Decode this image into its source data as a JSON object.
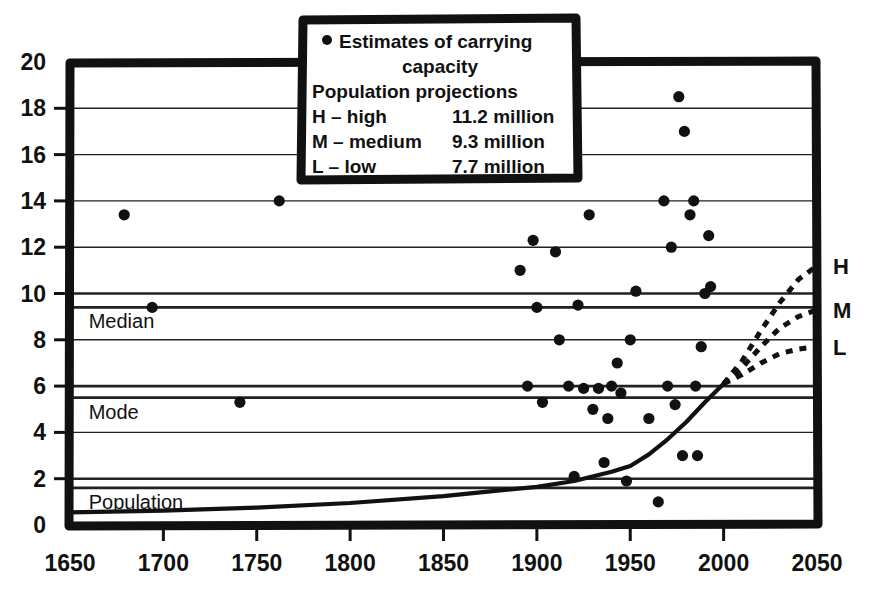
{
  "chart_data": {
    "type": "scatter",
    "title": "",
    "subtitle": "",
    "xlabel": "",
    "ylabel": "",
    "xlim": [
      1650,
      2050
    ],
    "ylim": [
      0,
      20
    ],
    "grid": true,
    "x_ticks": [
      1650,
      1700,
      1750,
      1800,
      1850,
      1900,
      1950,
      2000,
      2050
    ],
    "y_ticks": [
      0,
      2,
      4,
      6,
      8,
      10,
      12,
      14,
      16,
      18,
      20
    ],
    "legend_position": "top-center",
    "series": [
      {
        "name": "Estimates of carrying capacity",
        "type": "scatter",
        "marker": "filled-circle",
        "points": [
          [
            1679,
            13.4
          ],
          [
            1694,
            9.4
          ],
          [
            1741,
            5.3
          ],
          [
            1762,
            14.0
          ],
          [
            1891,
            11.0
          ],
          [
            1895,
            6.0
          ],
          [
            1898,
            12.3
          ],
          [
            1900,
            9.4
          ],
          [
            1903,
            5.3
          ],
          [
            1910,
            11.8
          ],
          [
            1912,
            8.0
          ],
          [
            1917,
            6.0
          ],
          [
            1920,
            2.1
          ],
          [
            1922,
            9.5
          ],
          [
            1925,
            5.9
          ],
          [
            1928,
            13.4
          ],
          [
            1930,
            5.0
          ],
          [
            1933,
            5.9
          ],
          [
            1936,
            2.7
          ],
          [
            1938,
            4.6
          ],
          [
            1940,
            6.0
          ],
          [
            1943,
            7.0
          ],
          [
            1945,
            5.7
          ],
          [
            1948,
            1.9
          ],
          [
            1950,
            8.0
          ],
          [
            1953,
            10.1
          ],
          [
            1960,
            4.6
          ],
          [
            1965,
            1.0
          ],
          [
            1968,
            14.0
          ],
          [
            1970,
            6.0
          ],
          [
            1972,
            12.0
          ],
          [
            1974,
            5.2
          ],
          [
            1976,
            18.5
          ],
          [
            1978,
            3.0
          ],
          [
            1979,
            17.0
          ],
          [
            1982,
            13.4
          ],
          [
            1984,
            14.0
          ],
          [
            1985,
            6.0
          ],
          [
            1986,
            3.0
          ],
          [
            1988,
            7.7
          ],
          [
            1990,
            10.0
          ],
          [
            1992,
            12.5
          ],
          [
            1993,
            10.3
          ]
        ]
      },
      {
        "name": "Population",
        "type": "line",
        "style": "solid",
        "points": [
          [
            1650,
            0.55
          ],
          [
            1700,
            0.62
          ],
          [
            1750,
            0.75
          ],
          [
            1800,
            0.95
          ],
          [
            1850,
            1.25
          ],
          [
            1875,
            1.45
          ],
          [
            1900,
            1.65
          ],
          [
            1920,
            1.9
          ],
          [
            1940,
            2.3
          ],
          [
            1950,
            2.55
          ],
          [
            1960,
            3.05
          ],
          [
            1970,
            3.7
          ],
          [
            1980,
            4.45
          ],
          [
            1990,
            5.3
          ],
          [
            2000,
            6.1
          ]
        ]
      },
      {
        "name": "H",
        "type": "line",
        "style": "dotted",
        "points": [
          [
            2000,
            6.1
          ],
          [
            2010,
            7.1
          ],
          [
            2020,
            8.4
          ],
          [
            2030,
            9.6
          ],
          [
            2040,
            10.6
          ],
          [
            2050,
            11.2
          ]
        ]
      },
      {
        "name": "M",
        "type": "line",
        "style": "dotted",
        "points": [
          [
            2000,
            6.1
          ],
          [
            2010,
            6.8
          ],
          [
            2020,
            7.7
          ],
          [
            2030,
            8.5
          ],
          [
            2040,
            9.0
          ],
          [
            2050,
            9.3
          ]
        ]
      },
      {
        "name": "L",
        "type": "line",
        "style": "dotted",
        "points": [
          [
            2000,
            6.1
          ],
          [
            2010,
            6.5
          ],
          [
            2020,
            7.0
          ],
          [
            2030,
            7.4
          ],
          [
            2040,
            7.6
          ],
          [
            2050,
            7.7
          ]
        ]
      }
    ],
    "annotations": [
      {
        "name": "median-label",
        "text": "Median",
        "x": 1660,
        "y": 9.4,
        "align": "left"
      },
      {
        "name": "mode-label",
        "text": "Mode",
        "x": 1660,
        "y": 5.5,
        "align": "left"
      },
      {
        "name": "population-label",
        "text": "Population",
        "x": 1660,
        "y": 1.6,
        "align": "left"
      }
    ],
    "projection_labels": [
      {
        "key": "H",
        "label": "H",
        "y": 11.2
      },
      {
        "key": "M",
        "label": "M",
        "y": 9.3
      },
      {
        "key": "L",
        "label": "L",
        "y": 7.7
      }
    ]
  },
  "legend": {
    "marker_symbol": "•",
    "line1": "Estimates of carrying",
    "line2": "capacity",
    "line3": "Population projections",
    "rows": [
      {
        "key": "H",
        "label": "H – high",
        "value": "11.2 million"
      },
      {
        "key": "M",
        "label": "M – medium",
        "value": "9.3 million"
      },
      {
        "key": "L",
        "label": "L – low",
        "value": "7.7 million"
      }
    ]
  },
  "axes": {
    "y_tick_labels": [
      "0",
      "2",
      "4",
      "6",
      "8",
      "10",
      "12",
      "14",
      "16",
      "18",
      "20"
    ],
    "x_tick_labels": [
      "1650",
      "1700",
      "1750",
      "1800",
      "1850",
      "1900",
      "1950",
      "2000",
      "2050"
    ]
  },
  "colors": {
    "ink": "#111111",
    "grid": "#222222",
    "background": "#ffffff"
  }
}
